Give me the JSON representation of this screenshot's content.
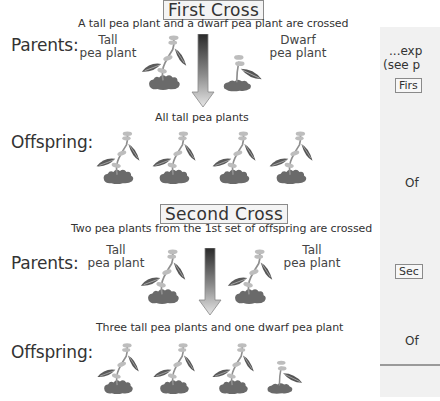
{
  "first_cross": {
    "title": "First Cross",
    "description": "A tall pea plant and a dwarf pea plant are crossed",
    "parents_label": "Parents:",
    "parent_left_label_line1": "Tall",
    "parent_left_label_line2": "pea plant",
    "parent_right_label_line1": "Dwarf",
    "parent_right_label_line2": "pea plant",
    "offspring_caption": "All tall pea plants",
    "offspring_label": "Offspring:",
    "offspring": [
      "tall",
      "tall",
      "tall",
      "tall"
    ]
  },
  "second_cross": {
    "title": "Second Cross",
    "description": "Two pea plants from the 1st set of offspring are crossed",
    "parents_label": "Parents:",
    "parent_left_label_line1": "Tall",
    "parent_left_label_line2": "pea plant",
    "parent_right_label_line1": "Tall",
    "parent_right_label_line2": "pea plant",
    "offspring_caption": "Three tall pea plants and one dwarf pea plant",
    "offspring_label": "Offspring:",
    "offspring": [
      "tall",
      "tall",
      "tall",
      "dwarf"
    ]
  },
  "side_panel": {
    "line1": "...exp",
    "line2": "(see p",
    "box1": "Firs",
    "offspring1": "Of",
    "box2": "Sec",
    "offspring2": "Of"
  },
  "colors": {
    "arrow_top": "#2a2a2a",
    "arrow_bottom": "#cfcfcf",
    "leaf_dark": "#555555",
    "leaf_light": "#bdbdbd",
    "soil": "#6a6a6a",
    "panel_bg": "#f1f1f1"
  }
}
